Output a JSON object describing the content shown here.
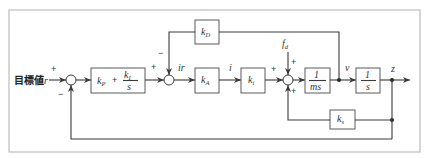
{
  "diagram": {
    "input_label_jp": "目標値",
    "input_symbol": "r",
    "signals": {
      "ir": "ir",
      "i": "i",
      "v": "v",
      "z": "z",
      "fd_main": "f",
      "fd_sub": "d"
    },
    "blocks": {
      "pi": {
        "kp_main": "k",
        "kp_sub": "P",
        "plus": "+",
        "ki_main": "k",
        "ki_sub": "I",
        "den": "s"
      },
      "kd": {
        "main": "k",
        "sub": "D"
      },
      "ka": {
        "main": "k",
        "sub": "A"
      },
      "ki": {
        "main": "k",
        "sub": "i"
      },
      "plant": {
        "num": "1",
        "den": "ms"
      },
      "integ": {
        "num": "1",
        "den": "s"
      },
      "ks": {
        "main": "k",
        "sub": "s"
      }
    },
    "signs": {
      "sum1_in": "+",
      "sum1_fb": "−",
      "sum2_in": "+",
      "sum2_fb": "−",
      "sum3_in": "+",
      "sum3_dist": "+",
      "sum3_fb": "+"
    }
  }
}
